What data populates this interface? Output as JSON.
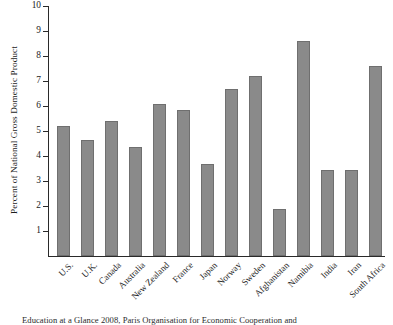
{
  "chart_data": {
    "type": "bar",
    "title": "",
    "xlabel": "",
    "ylabel": "Percent of National Gross Domestic Product",
    "ylim": [
      0,
      10
    ],
    "yticks": [
      1,
      2,
      3,
      4,
      5,
      6,
      7,
      8,
      9,
      10
    ],
    "grid": false,
    "legend": null,
    "bar_color": "#8a8a8a",
    "axis_color": "#2a2a2a",
    "categories": [
      "U.S.",
      "U.K.",
      "Canada",
      "Australia",
      "New Zealand",
      "France",
      "Japan",
      "Norway",
      "Sweden",
      "Afghanistan",
      "Namibia",
      "India",
      "Iran",
      "South Africa"
    ],
    "values": [
      5.2,
      4.65,
      5.4,
      4.35,
      6.1,
      5.85,
      3.7,
      6.7,
      7.2,
      1.9,
      8.6,
      3.45,
      3.45,
      7.6
    ]
  },
  "caption": {
    "text": "Education at a Glance 2008, Paris Organisation for Economic Cooperation and"
  }
}
